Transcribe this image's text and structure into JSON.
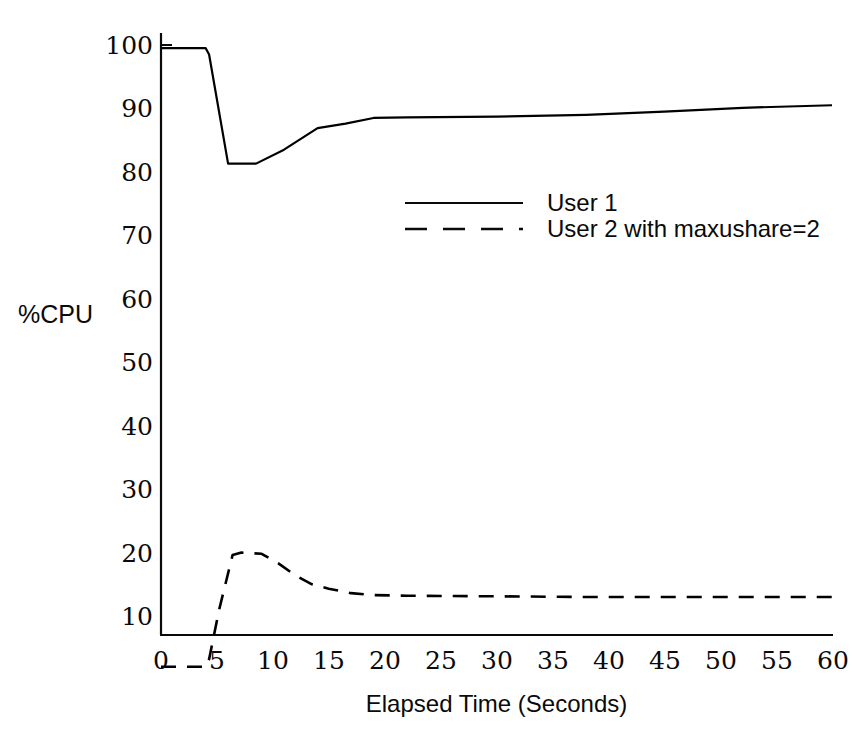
{
  "chart_data": {
    "type": "line",
    "title": "",
    "xlabel": "Elapsed Time (Seconds)",
    "ylabel": "%CPU",
    "xlim": [
      0,
      60
    ],
    "ylim": [
      0,
      100
    ],
    "xticks": [
      "0",
      "5",
      "10",
      "15",
      "20",
      "25",
      "30",
      "35",
      "40",
      "45",
      "50",
      "55",
      "60"
    ],
    "yticks": [
      "10",
      "20",
      "30",
      "40",
      "50",
      "60",
      "70",
      "80",
      "90",
      "100"
    ],
    "grid": false,
    "legend_position": "inside-upper-right",
    "series": [
      {
        "name": "User 1",
        "style": "solid",
        "color": "#000000",
        "x": [
          0,
          2,
          4,
          4.3,
          6,
          8.5,
          11,
          14,
          16.5,
          19,
          22,
          30,
          38,
          45,
          52,
          60
        ],
        "y": [
          99.5,
          99.5,
          99.5,
          98.5,
          81.3,
          81.3,
          83.5,
          86.9,
          87.6,
          88.5,
          88.6,
          88.7,
          89.0,
          89.5,
          90.1,
          90.5
        ]
      },
      {
        "name": "User 2 with maxushare=2",
        "style": "dashed",
        "color": "#000000",
        "x": [
          0,
          2,
          4,
          4.3,
          5.2,
          6.4,
          7.2,
          9.0,
          10.5,
          12.0,
          13.5,
          15.0,
          17.0,
          19.0,
          22.0,
          30.0,
          38.0,
          46.0,
          53.0,
          60.0
        ],
        "y": [
          2.0,
          2.0,
          2.0,
          3.2,
          11.0,
          19.6,
          20.0,
          19.8,
          18.3,
          16.4,
          15.0,
          14.3,
          13.6,
          13.3,
          13.2,
          13.1,
          13.0,
          13.0,
          13.0,
          13.0
        ]
      }
    ]
  },
  "legend": {
    "entries": [
      {
        "label": "User 1",
        "style": "solid"
      },
      {
        "label": "User 2 with maxushare=2",
        "style": "dashed"
      }
    ]
  },
  "axes": {
    "y_title": "%CPU",
    "x_title": "Elapsed Time (Seconds)"
  }
}
